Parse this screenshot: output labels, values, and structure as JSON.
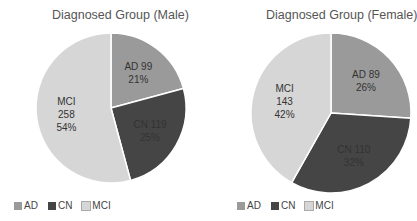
{
  "chart_data": [
    {
      "type": "pie",
      "title": "Diagnosed Group (Male)",
      "categories": [
        "AD",
        "CN",
        "MCI"
      ],
      "values": [
        99,
        119,
        258
      ],
      "percentages": [
        "21%",
        "25%",
        "54%"
      ],
      "labels": [
        [
          "AD 99",
          "21%"
        ],
        [
          "CN 119",
          "25%"
        ],
        [
          "MCI",
          "258",
          "54%"
        ]
      ],
      "legend": [
        "AD",
        "CN",
        "MCI"
      ],
      "legend_position": "bottom"
    },
    {
      "type": "pie",
      "title": "Diagnosed Group (Female)",
      "categories": [
        "AD",
        "CN",
        "MCI"
      ],
      "values": [
        89,
        110,
        143
      ],
      "percentages": [
        "26%",
        "32%",
        "42%"
      ],
      "labels": [
        [
          "AD 89",
          "26%"
        ],
        [
          "CN 110",
          "32%"
        ],
        [
          "MCI",
          "143",
          "42%"
        ]
      ],
      "legend": [
        "AD",
        "CN",
        "MCI"
      ],
      "legend_position": "bottom"
    }
  ],
  "colors": {
    "AD": "#9a9a9a",
    "CN": "#454545",
    "MCI": "#d6d6d6"
  }
}
